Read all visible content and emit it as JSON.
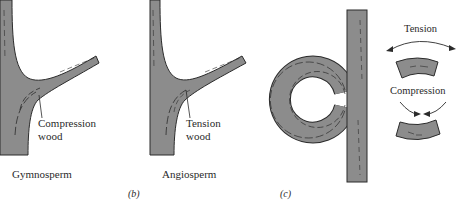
{
  "panels": {
    "a": {
      "annotation_line1": "Compression",
      "annotation_line2": "wood",
      "caption": "Gymnosperm"
    },
    "b": {
      "annotation_line1": "Tension",
      "annotation_line2": "wood",
      "caption": "Angiosperm",
      "letter": "(b)"
    },
    "c": {
      "letter": "(c)",
      "tension_label": "Tension",
      "compression_label": "Compression"
    }
  },
  "colors": {
    "wood_fill": "#8c8c8c",
    "outline": "#2b2b2b",
    "text": "#2a2a2a"
  }
}
